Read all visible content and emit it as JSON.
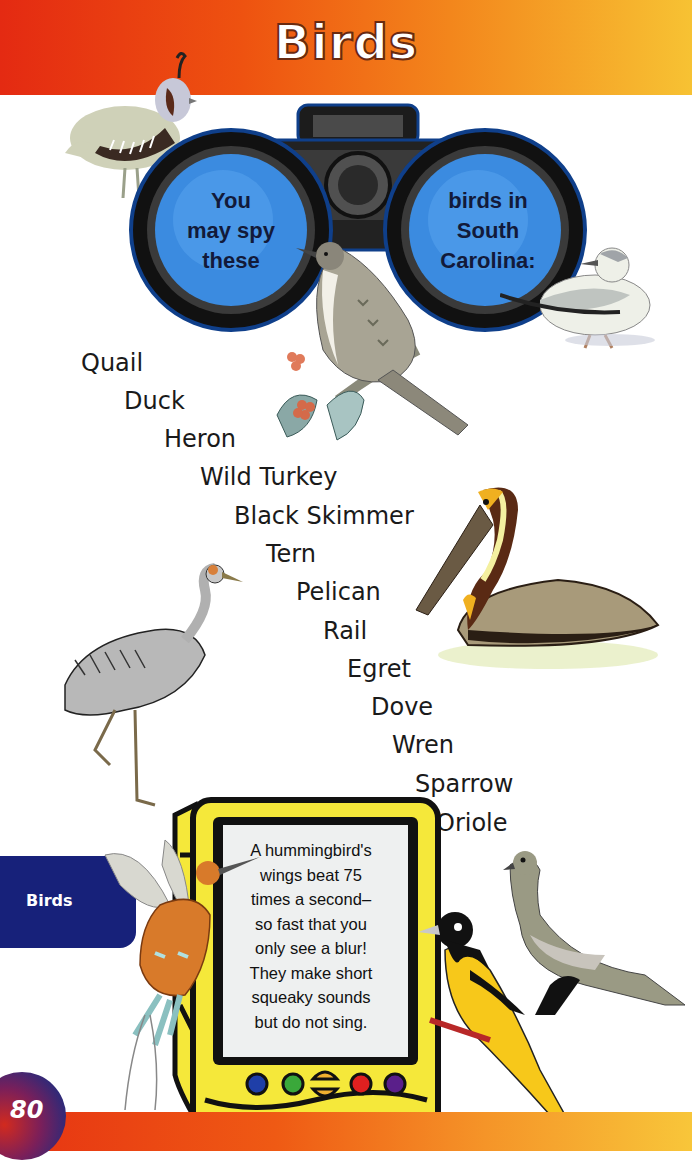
{
  "header": {
    "title": "Birds"
  },
  "binoculars": {
    "left_lens_lines": [
      "You",
      "may spy",
      "these"
    ],
    "right_lens_lines": [
      "birds in",
      "South",
      "Carolina:"
    ]
  },
  "bird_list": [
    "Quail",
    "Duck",
    "Heron",
    "Wild Turkey",
    "Black Skimmer",
    "Tern",
    "Pelican",
    "Rail",
    "Egret",
    "Dove",
    "Wren",
    "Sparrow",
    "Oriole"
  ],
  "fact_device": {
    "lines": [
      "A hummingbird's",
      "wings beat 75",
      "times a second–",
      "so fast that you",
      "only see a blur!",
      "They make short",
      "squeaky sounds",
      "but do not sing."
    ],
    "button_colors": [
      "#1f3fa8",
      "#3aa83a",
      "#f0b030",
      "#e02020",
      "#5a1f8a"
    ]
  },
  "side_tab": {
    "label": "Birds"
  },
  "page": {
    "number": "80"
  },
  "colors": {
    "header_start": "#e42a12",
    "header_end": "#f7c233",
    "tab_blue": "#17217a",
    "lens_blue": "#3d8ee0",
    "device_yellow": "#f5e83a"
  },
  "illustrations": [
    "quail-icon",
    "binoculars-icon",
    "sparrow-icon",
    "raspberry-icon",
    "skimmer-icon",
    "pelican-icon",
    "crane-icon",
    "hummingbird-icon",
    "oriole-icon",
    "dove-icon"
  ]
}
